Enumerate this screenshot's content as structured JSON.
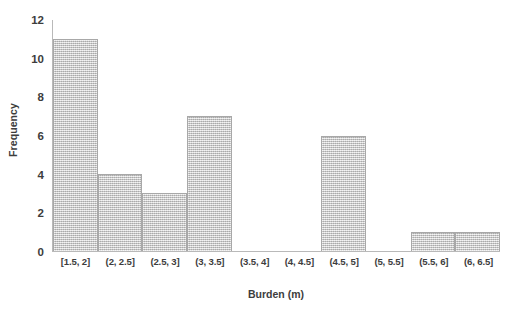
{
  "chart_data": {
    "type": "bar",
    "title": "",
    "subtitle": "",
    "xlabel": "Burden (m)",
    "ylabel": "Frequency",
    "categories": [
      "[1.5, 2]",
      "(2, 2.5]",
      "(2.5, 3]",
      "(3, 3.5]",
      "(3.5, 4]",
      "(4, 4.5]",
      "(4.5, 5]",
      "(5, 5.5]",
      "(5.5, 6]",
      "(6, 6.5]"
    ],
    "values": [
      11,
      4,
      3,
      7,
      0,
      0,
      6,
      0,
      1,
      1
    ],
    "ylim": [
      0,
      12
    ],
    "ytick_labels": [
      "12",
      "10",
      "8",
      "6",
      "4",
      "2",
      "0"
    ],
    "ytick_values": [
      12,
      10,
      8,
      6,
      4,
      2,
      0
    ],
    "ystep": 2,
    "grid": false,
    "legend": "none",
    "bar_style": "contiguous-histogram",
    "bar_fill_color": "#d2d2d2",
    "bar_border_color": "#a8a8a8",
    "axis_color": "#b9b9b9",
    "text_color": "#3d3d3d",
    "background_color": "#ffffff"
  }
}
